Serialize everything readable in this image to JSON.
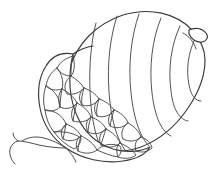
{
  "artwork": {
    "title": "Acorn",
    "subject": "acorn",
    "style": "line-art-outline",
    "medium": "coloring-page-drawing",
    "background_color": "#ffffff",
    "ink_color": "#3a3a3a",
    "canvas": {
      "width": 219,
      "height": 181
    },
    "fill_color": "none",
    "orientation": "tilted-diagonal-nut-pointing-upper-right"
  },
  "parts": {
    "nut": {
      "name": "acorn nut body",
      "band_count": 6,
      "tip_label": "pointed tip with notch",
      "outline_path": "M 69 71 C 76 44 96 24 123 15 C 150 7 176 13 192 30 C 200 39 205 50 205 60 C 205 75 199 92 188 108 C 176 126 159 140 141 147 C 124 153 108 152 96 144 C 82 134 73 115 69 95 Z",
      "bands": [
        "M 96 23 C 91 42 89 66 90 91 C 91 116 95 135 101 148",
        "M 117 16 C 110 38 107 64 109 92 C 111 120 117 139 125 150",
        "M 139 14 C 131 37 128 65 131 93 C 134 121 141 138 149 146",
        "M 161 18 C 152 40 149 67 152 93 C 155 118 162 132 171 136",
        "M 180 26 C 171 45 168 69 171 91 C 173 110 180 120 188 121",
        "M 195 39 C 188 53 186 70 189 85 C 191 95 195 101 201 101"
      ],
      "tip_notch_path": "M 189 30 C 195 27 202 28 206 33 C 209 37 207 41 202 42 C 197 43 191 39 189 34 Z",
      "tip_inner_path": "M 183 33 C 189 36 194 42 196 49"
    },
    "cap": {
      "name": "acorn cap (cupule)",
      "scale_count": 22,
      "outline_path": "M 73 54 C 62 52 52 56 46 66 C 39 77 37 92 40 108 C 43 124 52 138 66 148 C 82 159 104 164 123 161 C 137 159 146 154 150 147 C 140 152 126 153 113 149 C 98 144 85 133 78 118 C 70 101 67 80 73 54 Z",
      "rim_path": "M 73 54 C 79 50 86 47 93 46",
      "scales": [
        "M 73 56 C 66 58 60 62 57 68 C 60 73 65 76 71 76 C 75 72 75 63 73 56 Z",
        "M 57 68 C 51 72 47 79 46 86 C 50 90 56 91 62 89 C 64 82 62 74 57 68 Z",
        "M 71 76 C 76 79 81 83 84 88 C 80 93 73 95 67 94 C 63 88 65 80 71 76 Z",
        "M 46 86 C 43 94 43 102 45 110 C 50 112 56 111 60 107 C 60 99 55 90 46 86 Z",
        "M 62 89 C 68 92 74 97 77 103 C 73 108 66 110 60 107 C 58 101 58 94 62 89 Z",
        "M 84 88 C 90 90 96 94 99 99 C 95 105 88 107 82 105 C 78 99 79 92 84 88 Z",
        "M 45 110 C 46 118 49 126 54 132 C 59 132 64 129 66 124 C 63 116 55 110 45 110 Z",
        "M 77 103 C 83 106 89 111 91 117 C 87 122 79 123 73 121 C 70 114 72 107 77 103 Z",
        "M 99 99 C 105 101 111 105 114 110 C 110 116 103 118 97 116 C 93 110 94 103 99 99 Z",
        "M 66 124 C 72 126 78 130 81 136 C 76 141 69 142 63 139 C 60 134 61 128 66 124 Z",
        "M 91 117 C 97 119 103 123 106 129 C 101 134 94 135 88 132 C 85 126 86 120 91 117 Z",
        "M 114 110 C 120 112 126 117 128 123 C 123 128 116 129 110 126 C 107 120 109 113 114 110 Z",
        "M 54 132 C 59 139 66 145 74 149 C 78 147 81 143 81 138 C 74 133 64 131 54 132 Z",
        "M 81 136 C 88 139 94 144 97 150 C 92 154 84 154 78 151 C 75 145 76 139 81 136 Z",
        "M 106 129 C 112 132 118 137 120 143 C 115 148 107 148 101 145 C 98 139 100 132 106 129 Z",
        "M 128 123 C 134 126 139 131 141 137 C 136 142 129 142 123 139 C 120 133 123 126 128 123 Z",
        "M 97 150 C 104 153 111 156 118 157 C 121 154 122 150 120 146 C 112 143 103 144 97 150 Z",
        "M 120 143 C 127 146 133 150 136 155 C 131 159 124 159 118 157 C 116 151 116 146 120 143 Z",
        "M 141 137 C 147 139 151 143 152 148 C 148 152 142 153 136 151 C 134 145 136 139 141 137 Z"
      ],
      "scale_creases": [
        "M 73 56 C 71 63 71 70 71 76",
        "M 84 88 C 82 94 81 100 82 105",
        "M 99 99 C 97 105 96 111 97 116",
        "M 62 89 C 61 95 60 101 60 107",
        "M 77 103 C 75 109 74 115 73 121",
        "M 91 117 C 89 123 88 128 88 132",
        "M 114 110 C 112 116 111 121 110 126",
        "M 66 124 C 65 130 64 135 63 139",
        "M 81 136 C 79 142 78 147 78 151",
        "M 106 129 C 104 135 102 141 101 145"
      ]
    },
    "stem": {
      "name": "acorn stem twig",
      "branch_count": 4,
      "main_path": "M 66 148 C 58 148 48 147 39 145 C 31 143 24 141 18 141",
      "fork_upper_path": "M 66 148 C 60 144 52 140 44 138 C 36 136 28 137 22 141",
      "tip_a_path": "M 18 141 C 14 142 11 145 10 149 C 9 154 11 160 15 164",
      "tip_b_path": "M 18 141 C 15 139 13 136 13 133",
      "junction_path": "M 66 148 C 70 152 74 157 76 162",
      "junction_b_path": "M 66 148 C 71 149 77 151 82 154",
      "node_path": "M 64 146 C 67 145 70 145 72 147"
    }
  }
}
